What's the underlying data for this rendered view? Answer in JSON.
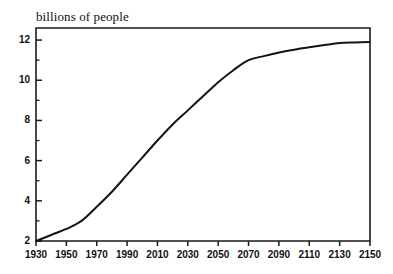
{
  "chart_data": {
    "type": "line",
    "title": "billions of people",
    "xlabel": "",
    "ylabel": "billions of people",
    "xlim": [
      1930,
      2150
    ],
    "ylim": [
      2,
      12.6
    ],
    "grid": false,
    "legend": null,
    "x_ticks": [
      1930,
      1950,
      1970,
      1990,
      2010,
      2030,
      2050,
      2070,
      2090,
      2110,
      2130,
      2150
    ],
    "x_tick_labels": [
      "1930",
      "1950",
      "1970",
      "1990",
      "2010",
      "2030",
      "2050",
      "2070",
      "2090",
      "2110",
      "2130",
      "2150"
    ],
    "y_ticks": [
      2,
      4,
      6,
      8,
      10,
      12
    ],
    "y_tick_labels": [
      "2",
      "4",
      "6",
      "8",
      "10",
      "12"
    ],
    "y_minor_ticks": [
      3,
      5,
      7,
      9,
      11
    ],
    "x_minor_ticks": [
      1940,
      1960,
      1980,
      2000,
      2020,
      2040,
      2060,
      2080,
      2100,
      2120,
      2140
    ],
    "series": [
      {
        "name": "world population",
        "color": "#141414",
        "x": [
          1930,
          1940,
          1950,
          1960,
          1970,
          1980,
          1990,
          2000,
          2010,
          2020,
          2030,
          2040,
          2050,
          2060,
          2070,
          2080,
          2090,
          2100,
          2110,
          2120,
          2130,
          2140,
          2150
        ],
        "values": [
          2.0,
          2.3,
          2.6,
          3.0,
          3.7,
          4.45,
          5.3,
          6.15,
          7.0,
          7.8,
          8.5,
          9.2,
          9.9,
          10.5,
          11.0,
          11.2,
          11.38,
          11.52,
          11.64,
          11.75,
          11.85,
          11.88,
          11.9
        ]
      }
    ]
  },
  "axes": {
    "frame_color": "#1a1a1a",
    "background": "#ffffff"
  }
}
